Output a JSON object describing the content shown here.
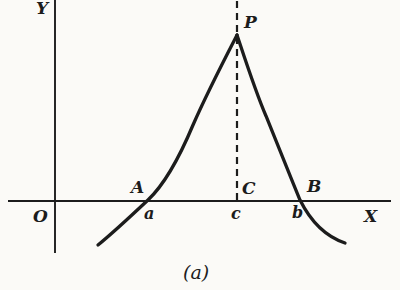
{
  "figure": {
    "background_color": "#fbfaf7",
    "ink_color": "#1c1c1c",
    "caption": "(a)",
    "axis_labels": {
      "x": "X",
      "y": "Y",
      "origin": "O"
    },
    "point_labels": {
      "peak": "P",
      "A": "A",
      "a": "a",
      "C": "C",
      "c": "c",
      "B": "B",
      "b": "b"
    }
  }
}
